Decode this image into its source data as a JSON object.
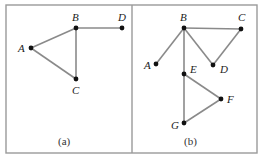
{
  "figure": {
    "panels": [
      {
        "caption": "(a)",
        "nodes": [
          {
            "id": "A",
            "label": "A",
            "x": 31,
            "y": 48
          },
          {
            "id": "B",
            "label": "B",
            "x": 76,
            "y": 28
          },
          {
            "id": "C",
            "label": "C",
            "x": 76,
            "y": 79
          },
          {
            "id": "D",
            "label": "D",
            "x": 122,
            "y": 28
          }
        ],
        "edges": [
          [
            "A",
            "B"
          ],
          [
            "B",
            "C"
          ],
          [
            "A",
            "C"
          ],
          [
            "B",
            "D"
          ]
        ]
      },
      {
        "caption": "(b)",
        "nodes": [
          {
            "id": "A",
            "label": "A",
            "x": 156,
            "y": 64
          },
          {
            "id": "B",
            "label": "B",
            "x": 184,
            "y": 28
          },
          {
            "id": "C",
            "label": "C",
            "x": 241,
            "y": 29
          },
          {
            "id": "D",
            "label": "D",
            "x": 213,
            "y": 65
          },
          {
            "id": "E",
            "label": "E",
            "x": 184,
            "y": 74
          },
          {
            "id": "F",
            "label": "F",
            "x": 221,
            "y": 99
          },
          {
            "id": "G",
            "label": "G",
            "x": 184,
            "y": 123
          }
        ],
        "edges": [
          [
            "B",
            "A"
          ],
          [
            "B",
            "C"
          ],
          [
            "B",
            "D"
          ],
          [
            "D",
            "C"
          ],
          [
            "B",
            "E"
          ],
          [
            "E",
            "F"
          ],
          [
            "E",
            "G"
          ],
          [
            "F",
            "G"
          ]
        ]
      }
    ]
  },
  "labels": {
    "a": {
      "A": "A",
      "B": "B",
      "C": "C",
      "D": "D",
      "caption": "(a)"
    },
    "b": {
      "A": "A",
      "B": "B",
      "C": "C",
      "D": "D",
      "E": "E",
      "F": "F",
      "G": "G",
      "caption": "(b)"
    }
  }
}
